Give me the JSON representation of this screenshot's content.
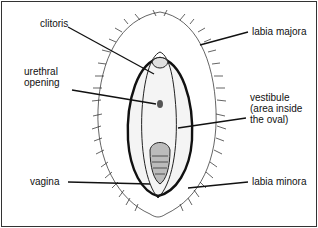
{
  "diagram": {
    "type": "anatomical-line-drawing",
    "labels": {
      "clitoris": "clitoris",
      "urethral_opening": [
        "urethral",
        "opening"
      ],
      "vagina": "vagina",
      "labia_majora": "labia majora",
      "vestibule": [
        "vestibule",
        "(area inside",
        "the oval)"
      ],
      "labia_minora": "labia minora"
    }
  }
}
